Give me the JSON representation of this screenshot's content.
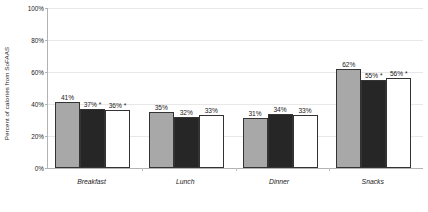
{
  "chart_data": {
    "type": "bar",
    "title": "",
    "subtitle": "",
    "xlabel": "",
    "ylabel": "Percent of calories from SoFAAS",
    "ylim": [
      0,
      100
    ],
    "y_tick_labels": [
      "100%",
      "80%",
      "60%",
      "40%",
      "20%",
      "0%"
    ],
    "y_tick_values": [
      100,
      80,
      60,
      40,
      20,
      0
    ],
    "grid": true,
    "legend": "none",
    "categories": [
      "Breakfast",
      "Lunch",
      "Dinner",
      "Snacks"
    ],
    "series": [
      {
        "name": "series-1",
        "color": "#a8a8a8",
        "values": [
          41,
          35,
          31,
          62
        ],
        "labels": [
          "41%",
          "35%",
          "31%",
          "62%"
        ]
      },
      {
        "name": "series-2",
        "color": "#262626",
        "values": [
          37,
          32,
          34,
          55
        ],
        "labels": [
          "37% *",
          "32%",
          "34%",
          "55% *"
        ]
      },
      {
        "name": "series-3",
        "color": "#ffffff",
        "values": [
          36,
          33,
          33,
          56
        ],
        "labels": [
          "36% *",
          "33%",
          "33%",
          "56% *"
        ]
      }
    ],
    "annotations": [
      "*"
    ]
  }
}
